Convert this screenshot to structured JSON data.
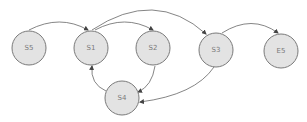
{
  "diagram": {
    "type": "state-graph",
    "colors": {
      "node_fill": "#e3e3e3",
      "node_stroke": "#7a7a7a",
      "edge": "#666666",
      "label": "#7a7a7a"
    },
    "nodes": [
      {
        "id": "S5",
        "label": "S5"
      },
      {
        "id": "S1",
        "label": "S1"
      },
      {
        "id": "S2",
        "label": "S2"
      },
      {
        "id": "S3",
        "label": "S3"
      },
      {
        "id": "E5",
        "label": "E5"
      },
      {
        "id": "S4",
        "label": "S4"
      }
    ],
    "edges": [
      {
        "from": "S5",
        "to": "S1"
      },
      {
        "from": "S1",
        "to": "S2"
      },
      {
        "from": "S1",
        "to": "S3"
      },
      {
        "from": "S3",
        "to": "E5"
      },
      {
        "from": "S2",
        "to": "S4"
      },
      {
        "from": "S3",
        "to": "S4"
      },
      {
        "from": "S4",
        "to": "S1"
      }
    ]
  }
}
